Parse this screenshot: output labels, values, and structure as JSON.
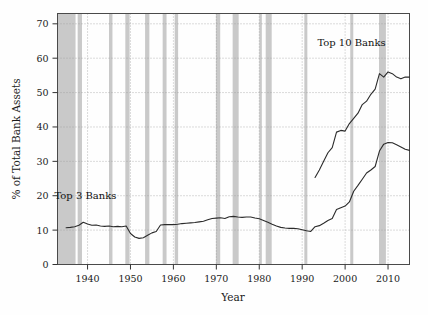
{
  "chart_data": {
    "type": "line",
    "title": "",
    "xlabel": "Year",
    "ylabel": "% of Total Bank Assets",
    "xlim": [
      1933,
      2015
    ],
    "ylim": [
      0,
      73
    ],
    "xticks": [
      1940,
      1950,
      1960,
      1970,
      1980,
      1990,
      2000,
      2010
    ],
    "xtick_labels": [
      "1940",
      "1950",
      "1960",
      "1970",
      "1980",
      "1990",
      "2000",
      "2010"
    ],
    "yticks": [
      0,
      10,
      20,
      30,
      40,
      50,
      60,
      70
    ],
    "ytick_labels": [
      "0",
      "10",
      "20",
      "30",
      "40",
      "50",
      "60",
      "70"
    ],
    "grid": "dotted-both",
    "legend_position": "inline-annotations",
    "annotations": [
      {
        "text": "Top 3 Banks",
        "x": 1939.5,
        "y": 19.0
      },
      {
        "text": "Top 10 Banks",
        "x": 2001.5,
        "y": 63.5
      }
    ],
    "series": [
      {
        "name": "Top 3 Banks",
        "color": "#2b2b2b",
        "x": [
          1935,
          1936,
          1937,
          1938,
          1939,
          1940,
          1941,
          1942,
          1943,
          1944,
          1945,
          1946,
          1947,
          1948,
          1949,
          1950,
          1951,
          1952,
          1953,
          1954,
          1955,
          1956,
          1957,
          1958,
          1959,
          1960,
          1961,
          1962,
          1963,
          1964,
          1965,
          1966,
          1967,
          1968,
          1969,
          1970,
          1971,
          1972,
          1973,
          1974,
          1975,
          1976,
          1977,
          1978,
          1979,
          1980,
          1981,
          1982,
          1983,
          1984,
          1985,
          1986,
          1987,
          1988,
          1989,
          1990,
          1991,
          1992,
          1993,
          1994,
          1995,
          1996,
          1997,
          1998,
          1999,
          2000,
          2001,
          2002,
          2003,
          2004,
          2005,
          2006,
          2007,
          2008,
          2009,
          2010,
          2011,
          2012,
          2013,
          2014,
          2015
        ],
        "values": [
          10.7,
          10.8,
          11.0,
          11.4,
          12.3,
          11.8,
          11.4,
          11.5,
          11.2,
          11.1,
          11.2,
          11.0,
          11.1,
          11.0,
          11.2,
          9.0,
          8.0,
          7.6,
          7.8,
          8.5,
          9.2,
          9.6,
          11.5,
          11.6,
          11.6,
          11.6,
          11.7,
          11.9,
          12.0,
          12.1,
          12.2,
          12.4,
          12.6,
          13.0,
          13.4,
          13.5,
          13.6,
          13.4,
          13.9,
          14.0,
          13.8,
          13.7,
          13.8,
          13.8,
          13.5,
          13.3,
          12.8,
          12.3,
          11.7,
          11.2,
          10.8,
          10.6,
          10.5,
          10.5,
          10.4,
          10.1,
          9.8,
          9.6,
          11.0,
          11.3,
          12.0,
          12.8,
          13.4,
          16.0,
          16.5,
          17.0,
          18.2,
          21.3,
          23.0,
          24.8,
          26.6,
          27.5,
          28.5,
          33.0,
          35.0,
          35.5,
          35.4,
          34.8,
          34.2,
          33.5,
          33.2
        ]
      },
      {
        "name": "Top 10 Banks",
        "color": "#2b2b2b",
        "x": [
          1993,
          1994,
          1995,
          1996,
          1997,
          1998,
          1999,
          2000,
          2001,
          2002,
          2003,
          2004,
          2005,
          2006,
          2007,
          2008,
          2009,
          2010,
          2011,
          2012,
          2013,
          2014,
          2015
        ],
        "values": [
          25.3,
          27.5,
          30.0,
          32.5,
          34.0,
          38.5,
          39.0,
          38.8,
          41.0,
          42.5,
          44.0,
          46.5,
          47.5,
          49.5,
          51.0,
          55.5,
          54.5,
          56.0,
          55.5,
          54.5,
          54.0,
          54.5,
          54.5
        ]
      }
    ],
    "recession_bands": [
      {
        "start": 1933.0,
        "end": 1937.2
      },
      {
        "start": 1937.7,
        "end": 1938.7
      },
      {
        "start": 1945.0,
        "end": 1945.8
      },
      {
        "start": 1948.8,
        "end": 1949.8
      },
      {
        "start": 1953.4,
        "end": 1954.4
      },
      {
        "start": 1957.5,
        "end": 1958.4
      },
      {
        "start": 1960.3,
        "end": 1961.1
      },
      {
        "start": 1969.9,
        "end": 1970.9
      },
      {
        "start": 1973.8,
        "end": 1975.2
      },
      {
        "start": 1980.0,
        "end": 1980.6
      },
      {
        "start": 1981.5,
        "end": 1982.9
      },
      {
        "start": 1990.5,
        "end": 1991.2
      },
      {
        "start": 2001.2,
        "end": 2001.9
      },
      {
        "start": 2007.9,
        "end": 2009.5
      }
    ],
    "band_color": "#c0c0c0"
  }
}
